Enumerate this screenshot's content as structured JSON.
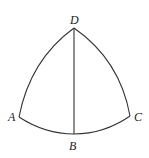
{
  "diagram": {
    "type": "curvilinear-triangle",
    "points": {
      "A": {
        "label": "A",
        "x": 19,
        "y": 117
      },
      "B": {
        "label": "B",
        "x": 74,
        "y": 134
      },
      "C": {
        "label": "C",
        "x": 130,
        "y": 116
      },
      "D": {
        "label": "D",
        "x": 74,
        "y": 28
      }
    },
    "edges": [
      {
        "from": "D",
        "to": "A",
        "shape": "arc"
      },
      {
        "from": "D",
        "to": "C",
        "shape": "arc"
      },
      {
        "from": "A",
        "to": "B",
        "shape": "arc"
      },
      {
        "from": "B",
        "to": "C",
        "shape": "arc"
      },
      {
        "from": "D",
        "to": "B",
        "shape": "straight"
      }
    ],
    "colors": {
      "stroke": "#333333",
      "label": "#222222",
      "background": "#ffffff"
    }
  }
}
